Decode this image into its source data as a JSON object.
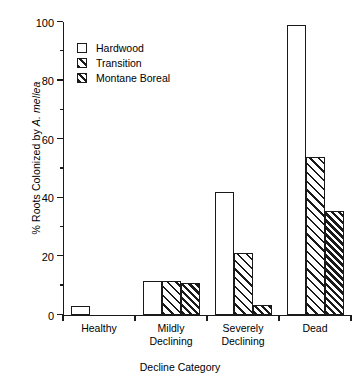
{
  "chart_data": {
    "type": "bar",
    "title": "",
    "xlabel": "Decline Category",
    "ylabel_prefix": "% Roots Colonized by ",
    "ylabel_species": "A. mellea",
    "ylabel_full": "% Roots Colonized by A. mellea",
    "categories": [
      "Healthy",
      "Mildly Declining",
      "Severely Declining",
      "Dead"
    ],
    "category_lines": [
      [
        "Healthy"
      ],
      [
        "Mildly",
        "Declining"
      ],
      [
        "Severely",
        "Declining"
      ],
      [
        "Dead"
      ]
    ],
    "series": [
      {
        "name": "Hardwood",
        "pattern": "empty",
        "values": [
          3,
          11.5,
          42,
          99
        ]
      },
      {
        "name": "Transition",
        "pattern": "light-hatch",
        "values": [
          0,
          11.5,
          21,
          54
        ]
      },
      {
        "name": "Montane Boreal",
        "pattern": "dense-hatch",
        "values": [
          0,
          11,
          3.5,
          35.5
        ]
      }
    ],
    "ylim": [
      0,
      100
    ],
    "ytick_major": [
      0,
      20,
      40,
      60,
      80,
      100
    ],
    "ytick_minor": [
      10,
      30,
      50,
      70,
      90
    ],
    "ytick_labels": [
      "0",
      "20",
      "40",
      "60",
      "80",
      "100"
    ],
    "grid": false,
    "legend_position": "upper-left",
    "colors": {
      "ink": "#1a1a1a",
      "background": "#ffffff"
    }
  },
  "legend": {
    "items": [
      {
        "label": "Hardwood"
      },
      {
        "label": "Transition"
      },
      {
        "label": "Montane Boreal"
      }
    ]
  }
}
